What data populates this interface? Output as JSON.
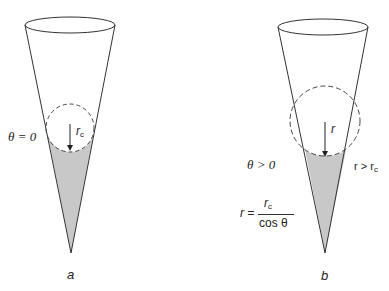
{
  "figure": {
    "panels": [
      {
        "id": "a",
        "caption": "a",
        "angle_label": "θ = 0",
        "radius_label": "r",
        "radius_subscript": "c",
        "fill_color": "#c8c8c8"
      },
      {
        "id": "b",
        "caption": "b",
        "angle_label": "θ > 0",
        "radius_label": "r",
        "comparison_label_main": "r > r",
        "comparison_label_sub": "c",
        "formula_lhs": "r =",
        "formula_num_main": "r",
        "formula_num_sub": "c",
        "formula_den": "cos θ",
        "fill_color": "#c8c8c8"
      }
    ],
    "colors": {
      "stroke": "#333333",
      "fill": "#c8c8c8",
      "background": "#ffffff"
    }
  }
}
